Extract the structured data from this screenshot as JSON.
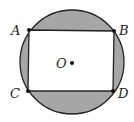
{
  "diagram": {
    "type": "geometry",
    "circle": {
      "center_label": "O",
      "cx": 72,
      "cy": 62,
      "r": 52,
      "fill": "#a6a6a6"
    },
    "rectangle": {
      "fill": "#ffffff"
    },
    "points": [
      {
        "label": "A",
        "x": 29,
        "y": 30,
        "lx": 12,
        "ly": 35
      },
      {
        "label": "B",
        "x": 114,
        "y": 31,
        "lx": 118,
        "ly": 36
      },
      {
        "label": "C",
        "x": 28,
        "y": 91,
        "lx": 11,
        "ly": 98
      },
      {
        "label": "D",
        "x": 113,
        "y": 91,
        "lx": 117,
        "ly": 98
      }
    ],
    "center_point": {
      "label": "O",
      "x": 72,
      "y": 63
    }
  }
}
